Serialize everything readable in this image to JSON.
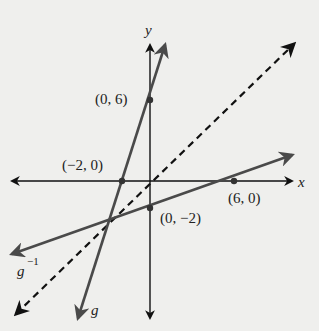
{
  "figure": {
    "axes": {
      "x_label": "x",
      "y_label": "y"
    },
    "lines": [
      {
        "name": "g",
        "label": "g",
        "style": "solid",
        "color": "#3a3a3a",
        "points": [
          [
            -2,
            0
          ],
          [
            0,
            6
          ]
        ],
        "slope": 3,
        "intercept": 6
      },
      {
        "name": "g_inverse",
        "label": "g",
        "label_sup": "−1",
        "style": "solid",
        "color": "#4a4a4a",
        "points": [
          [
            0,
            -2
          ],
          [
            6,
            0
          ]
        ],
        "slope": 0.3333,
        "intercept": -2
      },
      {
        "name": "identity",
        "label": "y = x",
        "style": "dashed",
        "color": "#111111"
      }
    ],
    "points": [
      {
        "label": "(0, 6)",
        "x": 0,
        "y": 6
      },
      {
        "label": "(−2, 0)",
        "x": -2,
        "y": 0
      },
      {
        "label": "(6, 0)",
        "x": 6,
        "y": 0
      },
      {
        "label": "(0, −2)",
        "x": 0,
        "y": -2
      }
    ]
  }
}
